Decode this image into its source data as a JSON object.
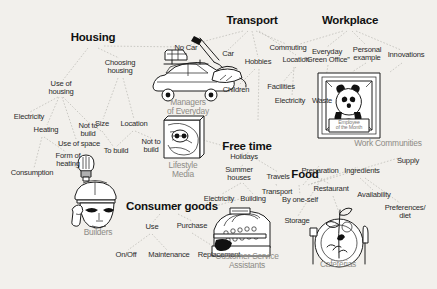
{
  "diagram": {
    "background_color": "#f2f0ec",
    "line_color": "#b9b7b2",
    "caption_color": "#8d8b86",
    "roots": [
      {
        "id": "housing",
        "label": "Housing",
        "x": 93,
        "y": 39
      },
      {
        "id": "transport",
        "label": "Transport",
        "x": 252,
        "y": 22
      },
      {
        "id": "workplace",
        "label": "Workplace",
        "x": 350,
        "y": 22
      },
      {
        "id": "freetime",
        "label": "Free time",
        "x": 247,
        "y": 148
      },
      {
        "id": "food",
        "label": "Food",
        "x": 305,
        "y": 176
      },
      {
        "id": "consumer",
        "label": "Consumer goods",
        "x": 172,
        "y": 208
      }
    ],
    "nodes": [
      {
        "id": "use-of-housing",
        "label": "Use of\nhousing",
        "x": 61,
        "y": 87
      },
      {
        "id": "choosing-housing",
        "label": "Choosing\nhousing",
        "x": 120,
        "y": 66
      },
      {
        "id": "size",
        "label": "Size",
        "x": 102,
        "y": 125
      },
      {
        "id": "location",
        "label": "Location",
        "x": 134,
        "y": 125
      },
      {
        "id": "electricity-housing",
        "label": "Electricity",
        "x": 29,
        "y": 118
      },
      {
        "id": "heating",
        "label": "Heating",
        "x": 46,
        "y": 131
      },
      {
        "id": "not-to-build-1",
        "label": "Not to\nbuild",
        "x": 88,
        "y": 129
      },
      {
        "id": "use-of-space",
        "label": "Use of space",
        "x": 79,
        "y": 145
      },
      {
        "id": "to-build",
        "label": "To build",
        "x": 115,
        "y": 152
      },
      {
        "id": "not-to-build-2",
        "label": "Not to\nbuild",
        "x": 151,
        "y": 144
      },
      {
        "id": "form-of-heating",
        "label": "Form of\nheating",
        "x": 68,
        "y": 158
      },
      {
        "id": "consumption",
        "label": "Consumption",
        "x": 32,
        "y": 174
      },
      {
        "id": "no-car",
        "label": "No Car",
        "x": 186,
        "y": 50
      },
      {
        "id": "car",
        "label": "Car",
        "x": 227,
        "y": 56
      },
      {
        "id": "hobbies",
        "label": "Hobbies",
        "x": 258,
        "y": 63
      },
      {
        "id": "commuting",
        "label": "Commuting",
        "x": 288,
        "y": 50
      },
      {
        "id": "location-transport",
        "label": "Location",
        "x": 296,
        "y": 61
      },
      {
        "id": "children",
        "label": "Children",
        "x": 236,
        "y": 91
      },
      {
        "id": "facilities",
        "label": "Facilities",
        "x": 281,
        "y": 88
      },
      {
        "id": "electricity-workplace",
        "label": "Electricity",
        "x": 290,
        "y": 102
      },
      {
        "id": "waste",
        "label": "Waste",
        "x": 322,
        "y": 102
      },
      {
        "id": "everyday-green-office",
        "label": "Everyday\n“Green Office”",
        "x": 327,
        "y": 55
      },
      {
        "id": "personal-example",
        "label": "Personal\nexample",
        "x": 367,
        "y": 53
      },
      {
        "id": "innovations",
        "label": "Innovations",
        "x": 406,
        "y": 56
      },
      {
        "id": "holidays",
        "label": "Holidays",
        "x": 244,
        "y": 158
      },
      {
        "id": "summer-houses",
        "label": "Summer\nhouses",
        "x": 239,
        "y": 172
      },
      {
        "id": "travels",
        "label": "Travels",
        "x": 278,
        "y": 178
      },
      {
        "id": "transport-freetime",
        "label": "Transport",
        "x": 277,
        "y": 193
      },
      {
        "id": "electricity-consumer",
        "label": "Electricity",
        "x": 219,
        "y": 200
      },
      {
        "id": "building",
        "label": "Building",
        "x": 253,
        "y": 200
      },
      {
        "id": "by-one-self",
        "label": "By one-self",
        "x": 300,
        "y": 201
      },
      {
        "id": "preparation",
        "label": "Preparation",
        "x": 320,
        "y": 172
      },
      {
        "id": "ingredients",
        "label": "Ingredients",
        "x": 362,
        "y": 172
      },
      {
        "id": "supply",
        "label": "Supply",
        "x": 408,
        "y": 162
      },
      {
        "id": "restaurant",
        "label": "Restaurant",
        "x": 331,
        "y": 190
      },
      {
        "id": "availability",
        "label": "Availability",
        "x": 374,
        "y": 196
      },
      {
        "id": "preferences-diet",
        "label": "Preferences/\ndiet",
        "x": 405,
        "y": 211
      },
      {
        "id": "storage",
        "label": "Storage",
        "x": 297,
        "y": 222
      },
      {
        "id": "use",
        "label": "Use",
        "x": 152,
        "y": 228
      },
      {
        "id": "purchase",
        "label": "Purchase",
        "x": 192,
        "y": 227
      },
      {
        "id": "on-off",
        "label": "On/Off",
        "x": 126,
        "y": 256
      },
      {
        "id": "maintenance",
        "label": "Maintenance",
        "x": 169,
        "y": 256
      },
      {
        "id": "replacement",
        "label": "Replacement",
        "x": 219,
        "y": 256
      }
    ],
    "illustrations": [
      {
        "id": "car-illustration",
        "icon": "car-icon",
        "caption": "Managers\nof Everyday",
        "caption_x": 188,
        "caption_y": 104
      },
      {
        "id": "magazine-illustration",
        "icon": "magazine-icon",
        "caption": "Lifestyle\nMedia",
        "caption_x": 183,
        "caption_y": 167
      },
      {
        "id": "poster-illustration",
        "icon": "panda-poster-icon",
        "caption": "Work Communities",
        "caption_x": 388,
        "caption_y": 144
      },
      {
        "id": "poster-plaque",
        "icon": "plaque-icon",
        "label": "Employee\nof the Month"
      },
      {
        "id": "builder-illustration",
        "icon": "builder-head-icon",
        "caption": "Builders",
        "caption_x": 98,
        "caption_y": 234
      },
      {
        "id": "register-illustration",
        "icon": "cash-register-icon",
        "caption": "Customer Service\nAssistants",
        "caption_x": 247,
        "caption_y": 258
      },
      {
        "id": "plate-illustration",
        "icon": "plate-cutlery-icon",
        "caption": "Cafeterias",
        "caption_x": 338,
        "caption_y": 266
      },
      {
        "id": "bulb-illustration",
        "icon": "lightbulb-icon"
      },
      {
        "id": "iron-illustration",
        "icon": "iron-icon"
      }
    ]
  }
}
